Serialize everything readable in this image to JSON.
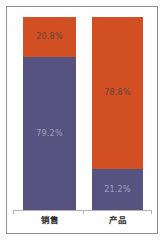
{
  "chart_data": {
    "type": "bar",
    "subtype": "stacked-100-percent-column",
    "title": "",
    "xlabel": "",
    "ylabel": "",
    "ylim": [
      0,
      100
    ],
    "unit": "%",
    "grid": false,
    "legend": false,
    "categories": [
      "销售",
      "产品"
    ],
    "colors": {
      "orange_segment": "#d24f24",
      "blue_segment": "#575380",
      "axis_line": "#b3b3b3",
      "frame_border": "#8f8f8f",
      "category_label": "#2f2f2f"
    },
    "bars": [
      {
        "category": "销售",
        "segments": [
          {
            "value": 20.8,
            "label": "20.8%",
            "color": "#d24f24",
            "label_color": "#64463b"
          },
          {
            "value": 79.2,
            "label": "79.2%",
            "color": "#575380",
            "label_color": "#a3a0b6"
          }
        ]
      },
      {
        "category": "产品",
        "segments": [
          {
            "value": 78.8,
            "label": "78.8%",
            "color": "#d24f24",
            "label_color": "#64463b"
          },
          {
            "value": 21.2,
            "label": "21.2%",
            "color": "#575380",
            "label_color": "#a3a0b6"
          }
        ]
      }
    ]
  }
}
